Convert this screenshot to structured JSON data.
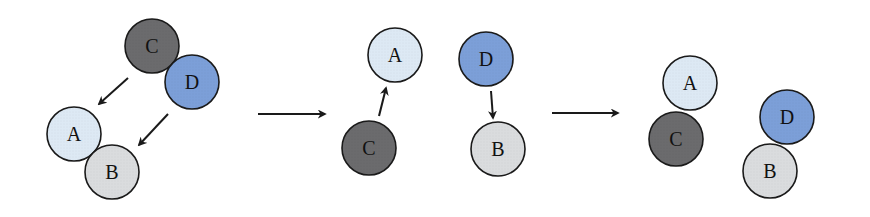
{
  "diagram": {
    "radius": 27,
    "colors": {
      "A": "#dde9f4",
      "B": "#dadcde",
      "C": "#6b6b6d",
      "D": "#7c9fd8",
      "stroke": "#1a1a1a",
      "arrow": "#1a1a1a"
    },
    "panels": [
      {
        "name": "initial",
        "nodes": [
          {
            "label": "C",
            "x": 152,
            "y": 46
          },
          {
            "label": "D",
            "x": 192,
            "y": 82
          },
          {
            "label": "A",
            "x": 74,
            "y": 134
          },
          {
            "label": "B",
            "x": 112,
            "y": 172
          }
        ],
        "arrows": [
          {
            "from": "C",
            "to": "A",
            "x1": 128,
            "y1": 78,
            "x2": 99,
            "y2": 104
          },
          {
            "from": "D",
            "to": "B",
            "x1": 168,
            "y1": 114,
            "x2": 139,
            "y2": 145
          }
        ]
      },
      {
        "name": "separated",
        "nodes": [
          {
            "label": "A",
            "x": 395,
            "y": 55
          },
          {
            "label": "C",
            "x": 369,
            "y": 148
          },
          {
            "label": "D",
            "x": 486,
            "y": 59
          },
          {
            "label": "B",
            "x": 498,
            "y": 149
          }
        ],
        "arrows": [
          {
            "from": "C",
            "to": "A",
            "x1": 379,
            "y1": 116,
            "x2": 386,
            "y2": 88
          },
          {
            "from": "D",
            "to": "B",
            "x1": 491,
            "y1": 91,
            "x2": 493,
            "y2": 118
          }
        ]
      },
      {
        "name": "exchanged",
        "nodes": [
          {
            "label": "A",
            "x": 690,
            "y": 83
          },
          {
            "label": "C",
            "x": 676,
            "y": 139
          },
          {
            "label": "D",
            "x": 787,
            "y": 117
          },
          {
            "label": "B",
            "x": 770,
            "y": 171
          }
        ],
        "arrows": []
      }
    ],
    "transitions": [
      {
        "x1": 258,
        "y1": 114,
        "x2": 325,
        "y2": 114
      },
      {
        "x1": 552,
        "y1": 113,
        "x2": 618,
        "y2": 113
      }
    ]
  }
}
